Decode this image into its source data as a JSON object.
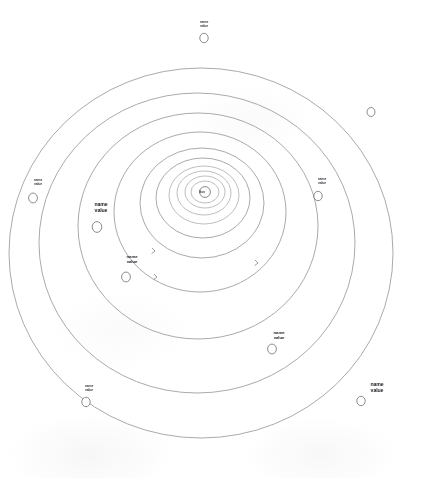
{
  "figure": {
    "type": "solar-system-orbit-diagram",
    "center_label": "Sun",
    "background": "#ffffff",
    "line_color": "#8d8d93",
    "text_color": "#2e2e33"
  },
  "orbits": [
    {
      "index": 1,
      "rx": 14,
      "ry": 11,
      "cx": 205,
      "cy": 192
    },
    {
      "index": 2,
      "rx": 20,
      "ry": 16,
      "cx": 205,
      "cy": 192
    },
    {
      "index": 3,
      "rx": 27,
      "ry": 22,
      "cx": 204,
      "cy": 193
    },
    {
      "index": 4,
      "rx": 35,
      "ry": 29,
      "cx": 204,
      "cy": 195
    },
    {
      "index": 5,
      "rx": 47,
      "ry": 40,
      "cx": 203,
      "cy": 198
    },
    {
      "index": 6,
      "rx": 62,
      "ry": 55,
      "cx": 202,
      "cy": 203
    },
    {
      "index": 7,
      "rx": 86,
      "ry": 80,
      "cx": 200,
      "cy": 212
    },
    {
      "index": 8,
      "rx": 120,
      "ry": 113,
      "cx": 198,
      "cy": 226
    },
    {
      "index": 9,
      "rx": 158,
      "ry": 150,
      "cx": 197,
      "cy": 243
    },
    {
      "index": 10,
      "rx": 192,
      "ry": 185,
      "cx": 201,
      "cy": 253
    }
  ],
  "planets": [
    {
      "id": "p-top",
      "name": "name",
      "value": "value",
      "cx": 204,
      "cy": 38,
      "r": 4.2,
      "label_x": 204,
      "label_y": 20,
      "size": "small",
      "orbit": 10
    },
    {
      "id": "p-right-upper",
      "name": "",
      "value": "",
      "cx": 371,
      "cy": 112,
      "r": 4.0,
      "label_x": 371,
      "label_y": 96,
      "size": "small",
      "orbit": 10
    },
    {
      "id": "p-left",
      "name": "name",
      "value": "value",
      "cx": 33,
      "cy": 198,
      "r": 4.4,
      "label_x": 38,
      "label_y": 178,
      "size": "small",
      "orbit": 10
    },
    {
      "id": "p-left-lower",
      "name": "name",
      "value": "value",
      "cx": 86,
      "cy": 402,
      "r": 4.2,
      "label_x": 89,
      "label_y": 384,
      "size": "small",
      "orbit": 10
    },
    {
      "id": "p-right-lower",
      "name": "name",
      "value": "value",
      "cx": 361,
      "cy": 401,
      "r": 4.2,
      "label_x": 377,
      "label_y": 381,
      "size": "big",
      "orbit": 10
    },
    {
      "id": "p-jupiter",
      "name": "name",
      "value": "value",
      "cx": 97,
      "cy": 227,
      "r": 4.8,
      "label_x": 101,
      "label_y": 201,
      "size": "big",
      "orbit": 9
    },
    {
      "id": "p-right-mid",
      "name": "name",
      "value": "value",
      "cx": 318,
      "cy": 196,
      "r": 4.2,
      "label_x": 322,
      "label_y": 177,
      "size": "small",
      "orbit": 9
    },
    {
      "id": "p-lower-mid",
      "name": "name",
      "value": "value",
      "cx": 272,
      "cy": 349,
      "r": 4.4,
      "label_x": 279,
      "label_y": 330,
      "size": "med",
      "orbit": 8
    },
    {
      "id": "p-inner-left",
      "name": "name",
      "value": "value",
      "cx": 126,
      "cy": 277,
      "r": 4.4,
      "label_x": 132,
      "label_y": 254,
      "size": "med",
      "orbit": 8
    }
  ],
  "direction_arrows": [
    {
      "x": 155,
      "y": 251
    },
    {
      "x": 157,
      "y": 277
    },
    {
      "x": 258,
      "y": 263
    }
  ]
}
